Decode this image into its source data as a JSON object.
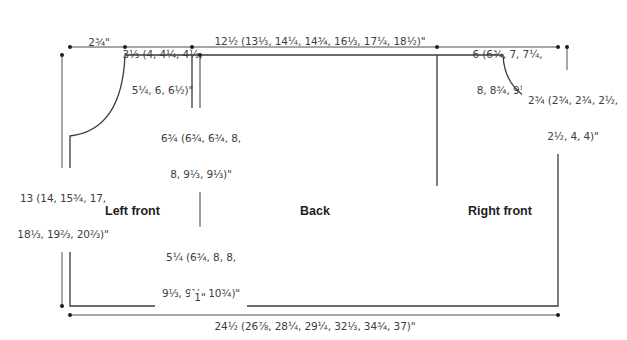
{
  "diagram": {
    "type": "knitting schematic",
    "colors": {
      "line": "#3a3a3a",
      "text": "#3d3d3d",
      "piece_label": "#1e1e1e",
      "background": "#ffffff"
    },
    "pieces": {
      "left_front": "Left front",
      "back": "Back",
      "right_front": "Right front"
    },
    "dimensions": {
      "left_shoulder_width": "2¾\"",
      "left_neck_width_line1": "3⅓ (4, 4¼, 4½,",
      "left_neck_width_line2": "5¼, 6, 6½)\"",
      "back_neck_width": "12½ (13⅓, 14¼, 14¾, 16⅓, 17¼, 18½)\"",
      "right_neck_width_line1": "6 (6¾, 7, 7¼,",
      "right_neck_width_line2": "8, 8¾, 9¼)\"",
      "armhole_depth_line1": "2¾ (2¾, 2¾, 2½,",
      "armhole_depth_line2": "2½, 4, 4)\"",
      "sleeve_slit_line1": "6¾ (6¾, 6¾, 8,",
      "sleeve_slit_line2": "8, 9⅓, 9⅓)\"",
      "total_length_line1": "13 (14, 15¾, 17,",
      "total_length_line2": "18⅓, 19⅔, 20⅔)\"",
      "lower_length_line1": "5¼ (6¾, 8, 8,",
      "lower_length_line2": "9⅓, 9⅓, 10¾)\"",
      "hem": "1\"",
      "total_width": "24½ (26⅞, 28¼, 29¼, 32⅓, 34¾, 37)\""
    }
  }
}
